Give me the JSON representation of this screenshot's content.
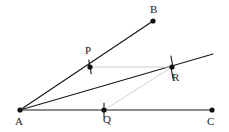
{
  "figure": {
    "kind": "geometry-diagram",
    "width": 229,
    "height": 132,
    "background_color": "#ffffff",
    "stroke_color": "#1a1a1a",
    "faint_stroke_color": "#cfcfcf",
    "point_color": "#111111",
    "label_color": "#1a1a1a"
  },
  "points": [
    {
      "id": "A",
      "label": "A",
      "x": 20,
      "y": 110,
      "label_x": 15,
      "label_y": 116,
      "dot": true,
      "tick": false
    },
    {
      "id": "B",
      "label": "B",
      "x": 153,
      "y": 21,
      "label_x": 150,
      "label_y": 4,
      "dot": true,
      "tick": false
    },
    {
      "id": "C",
      "label": "C",
      "x": 212,
      "y": 110,
      "label_x": 207,
      "label_y": 116,
      "dot": true,
      "tick": false
    },
    {
      "id": "P",
      "label": "P",
      "x": 90,
      "y": 67,
      "label_x": 85,
      "label_y": 45,
      "dot": true,
      "tick": true
    },
    {
      "id": "Q",
      "label": "Q",
      "x": 104,
      "y": 110,
      "label_x": 103,
      "label_y": 114,
      "dot": true,
      "tick": true
    },
    {
      "id": "R",
      "label": "R",
      "x": 172,
      "y": 67,
      "label_x": 172,
      "label_y": 72,
      "dot": true,
      "tick": true
    }
  ],
  "segments": [
    {
      "id": "ray-AB",
      "from": "A",
      "to": "B",
      "x1": 20,
      "y1": 110,
      "x2": 153,
      "y2": 21,
      "style": "solid",
      "weight": "thin"
    },
    {
      "id": "ray-A-through-R",
      "from": "A",
      "to": "ray-end",
      "x1": 20,
      "y1": 110,
      "x2": 213,
      "y2": 54,
      "style": "solid",
      "weight": "thin"
    },
    {
      "id": "segment-AC",
      "from": "A",
      "to": "C",
      "x1": 20,
      "y1": 110,
      "x2": 212,
      "y2": 110,
      "style": "solid",
      "weight": "thin"
    },
    {
      "id": "segment-PR",
      "from": "P",
      "to": "R",
      "x1": 90,
      "y1": 67,
      "x2": 172,
      "y2": 67,
      "style": "solid",
      "weight": "faint"
    },
    {
      "id": "segment-QR",
      "from": "Q",
      "to": "R",
      "x1": 104,
      "y1": 110,
      "x2": 172,
      "y2": 67,
      "style": "solid",
      "weight": "faint"
    }
  ],
  "tick_marks": [
    {
      "id": "tick-P",
      "at": "P",
      "x": 90,
      "y": 67,
      "half_length": 7,
      "angle_deg": 80
    },
    {
      "id": "tick-Q",
      "at": "Q",
      "x": 104,
      "y": 110,
      "half_length": 7,
      "angle_deg": 90
    },
    {
      "id": "tick-R-upper",
      "at": "R",
      "x": 172,
      "y": 62,
      "half_length": 6,
      "angle_deg": 80
    },
    {
      "id": "tick-R-lower",
      "at": "R",
      "x": 172,
      "y": 73,
      "half_length": 6,
      "angle_deg": 80
    }
  ]
}
